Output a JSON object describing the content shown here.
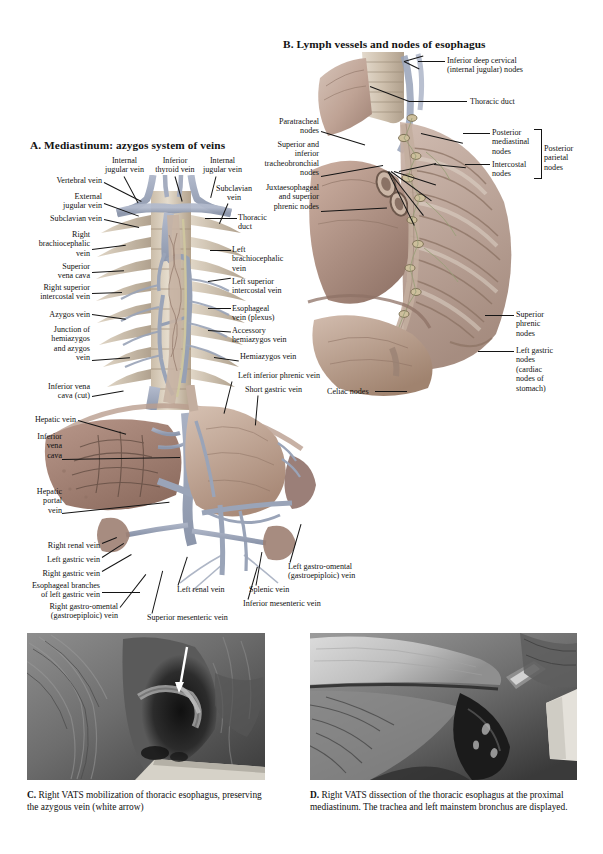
{
  "page": {
    "width": 603,
    "height": 854,
    "background": "#ffffff"
  },
  "panels": {
    "a": {
      "title": "A. Mediastinum: azygos system of veins",
      "labels": [
        {
          "id": "internal-jugular-vein-left",
          "text": "Internal\njugular vein"
        },
        {
          "id": "inferior-thyroid-vein",
          "text": "Inferior\nthyroid vein"
        },
        {
          "id": "internal-jugular-vein-right",
          "text": "Internal\njugular vein"
        },
        {
          "id": "vertebral-vein",
          "text": "Vertebral vein"
        },
        {
          "id": "subclavian-vein-upper",
          "text": "Subclavian\nvein"
        },
        {
          "id": "external-jugular-vein",
          "text": "External\njugular vein"
        },
        {
          "id": "subclavian-vein",
          "text": "Subclavian vein"
        },
        {
          "id": "thoracic-duct",
          "text": "Thoracic\nduct"
        },
        {
          "id": "right-brachiocephalic-vein",
          "text": "Right\nbrachiocephalic\nvein"
        },
        {
          "id": "left-brachiocephalic-vein",
          "text": "Left\nbrachiocephalic\nvein"
        },
        {
          "id": "superior-vena-cava",
          "text": "Superior\nvena cava"
        },
        {
          "id": "left-superior-intercostal-vein",
          "text": "Left superior\nintercostal vein"
        },
        {
          "id": "right-superior-intercostal-vein",
          "text": "Right superior\nintercostal vein"
        },
        {
          "id": "esophageal-vein-plexus",
          "text": "Esophageal\nvein (plexus)"
        },
        {
          "id": "azygos-vein",
          "text": "Azygos vein"
        },
        {
          "id": "accessory-hemiazygos-vein",
          "text": "Accessory\nhemiazygos vein"
        },
        {
          "id": "junction-hemiazygos-azygos",
          "text": "Junction of\nhemiazygos\nand azygos\nvein"
        },
        {
          "id": "hemiazygos-vein",
          "text": "Hemiazygos vein"
        },
        {
          "id": "inferior-vena-cava-cut",
          "text": "Inferior vena\ncava (cut)"
        },
        {
          "id": "left-inferior-phrenic-vein",
          "text": "Left inferior phrenic vein"
        },
        {
          "id": "short-gastric-vein",
          "text": "Short gastric vein"
        },
        {
          "id": "celiac-nodes",
          "text": "Celiac nodes"
        },
        {
          "id": "hepatic-vein",
          "text": "Hepatic vein"
        },
        {
          "id": "inferior-vena-cava",
          "text": "Inferior\nvena\ncava"
        },
        {
          "id": "hepatic-portal-vein",
          "text": "Hepatic\nportal\nvein"
        },
        {
          "id": "right-renal-vein",
          "text": "Right renal vein"
        },
        {
          "id": "left-gastric-vein",
          "text": "Left gastric vein"
        },
        {
          "id": "right-gastric-vein",
          "text": "Right gastric vein"
        },
        {
          "id": "esophageal-branches-left-gastric",
          "text": "Esophageal branches\nof left gastric vein"
        },
        {
          "id": "right-gastro-omental-vein",
          "text": "Right gastro-omental\n(gastroepiploic) vein"
        },
        {
          "id": "left-renal-vein",
          "text": "Left renal vein"
        },
        {
          "id": "superior-mesenteric-vein",
          "text": "Superior mesenteric vein"
        },
        {
          "id": "inferior-mesenteric-vein",
          "text": "Inferior mesenteric vein"
        },
        {
          "id": "splenic-vein",
          "text": "Splenic vein"
        },
        {
          "id": "left-gastro-omental-vein",
          "text": "Left gastro-omental\n(gastroepiploic) vein"
        }
      ]
    },
    "b": {
      "title": "B. Lymph vessels and nodes of esophagus",
      "labels": [
        {
          "id": "inferior-deep-cervical-nodes",
          "text": "Inferior deep cervical\n(internal jugular) nodes"
        },
        {
          "id": "thoracic-duct",
          "text": "Thoracic duct"
        },
        {
          "id": "paratracheal-nodes",
          "text": "Paratracheal\nnodes"
        },
        {
          "id": "tracheobronchial-nodes",
          "text": "Superior and\ninferior\ntracheobronchial\nnodes"
        },
        {
          "id": "juxtaesophageal-nodes",
          "text": "Juxtaesophageal\nand superior\nphrenic nodes"
        },
        {
          "id": "posterior-mediastinal-nodes",
          "text": "Posterior\nmediastinal\nnodes"
        },
        {
          "id": "intercostal-nodes",
          "text": "Intercostal\nnodes"
        },
        {
          "id": "posterior-parietal-nodes",
          "text": "Posterior\nparietal\nnodes"
        },
        {
          "id": "superior-phrenic-nodes",
          "text": "Superior\nphrenic\nnodes"
        },
        {
          "id": "left-gastric-nodes",
          "text": "Left gastric\nnodes\n(cardiac\nnodes of\nstomach)"
        }
      ]
    },
    "c": {
      "letter": "C.",
      "caption": "Right VATS mobilization of thoracic esophagus, preserving the azygous vein (white arrow)"
    },
    "d": {
      "letter": "D.",
      "caption": "Right VATS dissection of the thoracic esophagus at the proximal mediastinum. The trachea and left mainstem bronchus are displayed."
    }
  },
  "colors": {
    "text": "#111111",
    "leader": "#141414",
    "page_bg": "#ffffff",
    "tissue_light": "#d9c6bb",
    "tissue_mid": "#bda093",
    "tissue_dark": "#97786c",
    "vein_blue": "#9fa8bd",
    "bone": "#e0d6c8",
    "organ_liver": "#a98a7d",
    "photo_dark": "#2a2a2a",
    "photo_mid": "#6b6b6b",
    "photo_light": "#c9c9c9"
  }
}
